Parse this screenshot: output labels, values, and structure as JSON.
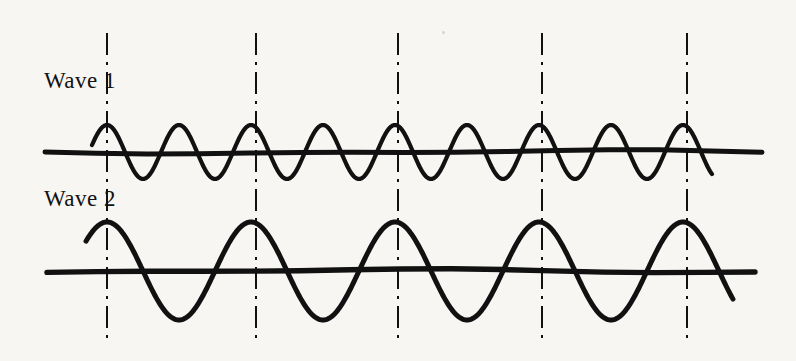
{
  "figure": {
    "background_color": "#f7f6f3",
    "ink_color": "#111111",
    "width": 796,
    "height": 361
  },
  "labels": {
    "wave_1": "Wave 1",
    "wave_2": "Wave 2"
  },
  "reference_lines": {
    "style": "dash-dot",
    "color": "#111111",
    "stroke_width": 2.0,
    "y_top": 33,
    "y_bottom": 345,
    "x_positions": [
      107,
      256,
      398,
      542,
      687
    ]
  },
  "chart_data": {
    "type": "line",
    "title": "",
    "xlabel": "",
    "ylabel": "",
    "grid": false,
    "legend": "none",
    "xlim": [
      45,
      762
    ],
    "annotations": [
      {
        "text": "Wave 1",
        "x": 44,
        "y": 85
      },
      {
        "text": "Wave 2",
        "x": 44,
        "y": 202
      }
    ],
    "vertical_reference_lines": [
      107,
      256,
      398,
      542,
      687
    ],
    "series": [
      {
        "name": "Wave 1",
        "baseline_y": 152,
        "amplitude": 27,
        "wavelength": 72,
        "cycles_between_reference_lines": 2,
        "phase_peak_at_x": 107,
        "x_start": 92,
        "x_end": 712,
        "baseline_x_start": 45,
        "baseline_x_end": 762,
        "stroke_width": 4.2
      },
      {
        "name": "Wave 2",
        "baseline_y": 271,
        "amplitude": 49,
        "wavelength": 144,
        "cycles_between_reference_lines": 1,
        "phase_peak_at_x": 107,
        "x_start": 86,
        "x_end": 733,
        "baseline_x_start": 47,
        "baseline_x_end": 755,
        "stroke_width": 5.0
      }
    ]
  }
}
